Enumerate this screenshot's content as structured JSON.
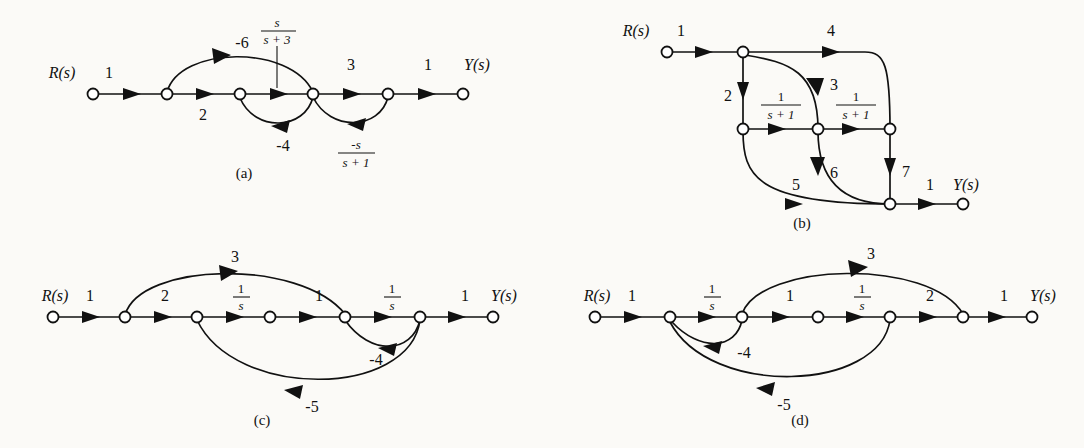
{
  "figure": {
    "background": "#fbfaf7",
    "ink": "#111111"
  },
  "graphs": [
    {
      "id": "a",
      "caption": "(a)",
      "input_label": "R(s)",
      "output_label": "Y(s)",
      "nodes": [
        {
          "name": "n1",
          "x": 93,
          "y": 94
        },
        {
          "name": "n2",
          "x": 167,
          "y": 94
        },
        {
          "name": "n3",
          "x": 240,
          "y": 94
        },
        {
          "name": "n4",
          "x": 313,
          "y": 94
        },
        {
          "name": "n5",
          "x": 388,
          "y": 94
        },
        {
          "name": "n6",
          "x": 463,
          "y": 94
        }
      ],
      "edges": [
        {
          "from": "n1",
          "to": "n2",
          "gain": "1",
          "kind": "forward",
          "position": "above"
        },
        {
          "from": "n2",
          "to": "n3",
          "gain": "2",
          "kind": "forward",
          "position": "below"
        },
        {
          "from": "n3",
          "to": "n4",
          "gain": "s/(s+3)",
          "kind": "forward",
          "position": "above",
          "fraction": {
            "num": "s",
            "den": "s + 3"
          }
        },
        {
          "from": "n4",
          "to": "n5",
          "gain": "3",
          "kind": "forward",
          "position": "above"
        },
        {
          "from": "n5",
          "to": "n6",
          "gain": "1",
          "kind": "forward",
          "position": "above"
        },
        {
          "from": "n2",
          "to": "n4",
          "gain": "-6",
          "kind": "feedforward-arc",
          "position": "above"
        },
        {
          "from": "n4",
          "to": "n3",
          "gain": "-4",
          "kind": "feedback-arc",
          "position": "below"
        },
        {
          "from": "n5",
          "to": "n4",
          "gain": "-s/(s+1)",
          "kind": "feedback-arc",
          "position": "below",
          "fraction": {
            "num": "-s",
            "den": "s + 1"
          }
        }
      ]
    },
    {
      "id": "b",
      "caption": "(b)",
      "input_label": "R(s)",
      "output_label": "Y(s)",
      "nodes": [
        {
          "name": "n1",
          "x": 667,
          "y": 52
        },
        {
          "name": "n2",
          "x": 743,
          "y": 52
        },
        {
          "name": "n3",
          "x": 743,
          "y": 129
        },
        {
          "name": "n4",
          "x": 818,
          "y": 129
        },
        {
          "name": "n5",
          "x": 890,
          "y": 129
        },
        {
          "name": "n6",
          "x": 890,
          "y": 204
        },
        {
          "name": "n7",
          "x": 963,
          "y": 204
        }
      ],
      "edges": [
        {
          "from": "n1",
          "to": "n2",
          "gain": "1",
          "kind": "forward",
          "position": "above"
        },
        {
          "from": "n2",
          "to": "n5",
          "gain": "4",
          "kind": "arc-right",
          "position": "above"
        },
        {
          "from": "n2",
          "to": "n3",
          "gain": "2",
          "kind": "vertical-down",
          "position": "left"
        },
        {
          "from": "n2",
          "to": "n4",
          "gain": "3",
          "kind": "curve-down",
          "position": "right"
        },
        {
          "from": "n3",
          "to": "n4",
          "gain": "1/(s+1)",
          "kind": "forward",
          "position": "above",
          "fraction": {
            "num": "1",
            "den": "s + 1"
          }
        },
        {
          "from": "n4",
          "to": "n5",
          "gain": "1/(s+1)",
          "kind": "forward",
          "position": "above",
          "fraction": {
            "num": "1",
            "den": "s + 1"
          }
        },
        {
          "from": "n3",
          "to": "n7",
          "gain": "5",
          "kind": "curve-down",
          "position": "above"
        },
        {
          "from": "n4",
          "to": "n7",
          "gain": "6",
          "kind": "curve-down",
          "position": "right"
        },
        {
          "from": "n5",
          "to": "n6",
          "gain": "7",
          "kind": "vertical-down",
          "position": "right"
        },
        {
          "from": "n6",
          "to": "n7",
          "gain": "1",
          "kind": "forward",
          "position": "above"
        }
      ]
    },
    {
      "id": "c",
      "caption": "(c)",
      "input_label": "R(s)",
      "output_label": "Y(s)",
      "nodes": [
        {
          "name": "n1",
          "x": 53,
          "y": 317
        },
        {
          "name": "n2",
          "x": 125,
          "y": 317
        },
        {
          "name": "n3",
          "x": 197,
          "y": 317
        },
        {
          "name": "n4",
          "x": 270,
          "y": 317
        },
        {
          "name": "n5",
          "x": 345,
          "y": 317
        },
        {
          "name": "n6",
          "x": 420,
          "y": 317
        },
        {
          "name": "n7",
          "x": 493,
          "y": 317
        }
      ],
      "edges": [
        {
          "from": "n1",
          "to": "n2",
          "gain": "1",
          "kind": "forward",
          "position": "above"
        },
        {
          "from": "n2",
          "to": "n3",
          "gain": "2",
          "kind": "forward",
          "position": "above"
        },
        {
          "from": "n3",
          "to": "n4",
          "gain": "1/s",
          "kind": "forward",
          "position": "above",
          "fraction": {
            "num": "1",
            "den": "s"
          }
        },
        {
          "from": "n4",
          "to": "n5",
          "gain": "1",
          "kind": "forward",
          "position": "above"
        },
        {
          "from": "n5",
          "to": "n6",
          "gain": "1/s",
          "kind": "forward",
          "position": "above",
          "fraction": {
            "num": "1",
            "den": "s"
          }
        },
        {
          "from": "n6",
          "to": "n7",
          "gain": "1",
          "kind": "forward",
          "position": "above"
        },
        {
          "from": "n2",
          "to": "n5",
          "gain": "3",
          "kind": "feedforward-arc",
          "position": "above"
        },
        {
          "from": "n6",
          "to": "n5",
          "gain": "-4",
          "kind": "feedback-arc",
          "position": "below"
        },
        {
          "from": "n6",
          "to": "n3",
          "gain": "-5",
          "kind": "feedback-arc",
          "position": "below"
        }
      ]
    },
    {
      "id": "d",
      "caption": "(d)",
      "input_label": "R(s)",
      "output_label": "Y(s)",
      "nodes": [
        {
          "name": "n1",
          "x": 595,
          "y": 317
        },
        {
          "name": "n2",
          "x": 670,
          "y": 317
        },
        {
          "name": "n3",
          "x": 742,
          "y": 317
        },
        {
          "name": "n4",
          "x": 818,
          "y": 317
        },
        {
          "name": "n5",
          "x": 890,
          "y": 317
        },
        {
          "name": "n6",
          "x": 963,
          "y": 317
        },
        {
          "name": "n7",
          "x": 1032,
          "y": 317
        }
      ],
      "edges": [
        {
          "from": "n1",
          "to": "n2",
          "gain": "1",
          "kind": "forward",
          "position": "above"
        },
        {
          "from": "n2",
          "to": "n3",
          "gain": "1/s",
          "kind": "forward",
          "position": "above",
          "fraction": {
            "num": "1",
            "den": "s"
          }
        },
        {
          "from": "n3",
          "to": "n4",
          "gain": "1",
          "kind": "forward",
          "position": "above"
        },
        {
          "from": "n4",
          "to": "n5",
          "gain": "1/s",
          "kind": "forward",
          "position": "above",
          "fraction": {
            "num": "1",
            "den": "s"
          }
        },
        {
          "from": "n5",
          "to": "n6",
          "gain": "2",
          "kind": "forward",
          "position": "above"
        },
        {
          "from": "n6",
          "to": "n7",
          "gain": "1",
          "kind": "forward",
          "position": "above"
        },
        {
          "from": "n3",
          "to": "n6",
          "gain": "3",
          "kind": "feedforward-arc",
          "position": "above"
        },
        {
          "from": "n3",
          "to": "n2",
          "gain": "-4",
          "kind": "feedback-arc",
          "position": "below"
        },
        {
          "from": "n5",
          "to": "n2",
          "gain": "-5",
          "kind": "feedback-arc",
          "position": "below"
        }
      ]
    }
  ],
  "labels": {
    "a": {
      "R": "R(s)",
      "Y": "Y(s)",
      "g_in": "1",
      "g_2": "2",
      "g_neg6": "-6",
      "g_3": "3",
      "g_out": "1",
      "g_neg4": "-4",
      "frac1_num": "s",
      "frac1_den": "s + 3",
      "frac2_num": "-s",
      "frac2_den": "s + 1",
      "caption": "(a)"
    },
    "b": {
      "R": "R(s)",
      "Y": "Y(s)",
      "g_in": "1",
      "g_4": "4",
      "g_2": "2",
      "g_3": "3",
      "g_5": "5",
      "g_6": "6",
      "g_7": "7",
      "g_out": "1",
      "frac1_num": "1",
      "frac1_den": "s + 1",
      "frac2_num": "1",
      "frac2_den": "s + 1",
      "caption": "(b)"
    },
    "c": {
      "R": "R(s)",
      "Y": "Y(s)",
      "g_in": "1",
      "g_2": "2",
      "g_3": "3",
      "g_1mid": "1",
      "g_out": "1",
      "g_neg4": "-4",
      "g_neg5": "-5",
      "frac1_num": "1",
      "frac1_den": "s",
      "frac2_num": "1",
      "frac2_den": "s",
      "caption": "(c)"
    },
    "d": {
      "R": "R(s)",
      "Y": "Y(s)",
      "g_in": "1",
      "g_1mid": "1",
      "g_3": "3",
      "g_2": "2",
      "g_out": "1",
      "g_neg4": "-4",
      "g_neg5": "-5",
      "frac1_num": "1",
      "frac1_den": "s",
      "frac2_num": "1",
      "frac2_den": "s",
      "caption": "(d)"
    }
  }
}
